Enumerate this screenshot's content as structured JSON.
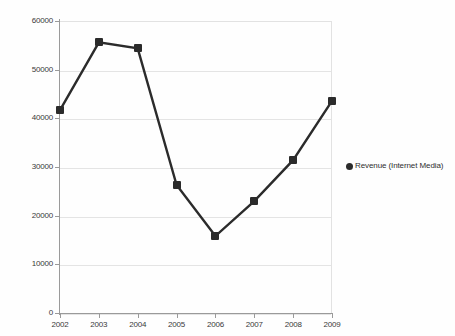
{
  "chart_data": {
    "type": "line",
    "title": "",
    "xlabel": "",
    "ylabel": "",
    "categories": [
      "2002",
      "2003",
      "2004",
      "2005",
      "2006",
      "2007",
      "2008",
      "2009"
    ],
    "values": [
      41700,
      55600,
      54400,
      26300,
      15800,
      23000,
      31400,
      43600
    ],
    "series": [
      {
        "name": "Revenue (Internet Media)",
        "values": [
          41700,
          55600,
          54400,
          26300,
          15800,
          23000,
          31400,
          43600
        ]
      }
    ],
    "ylim": [
      0,
      60000
    ],
    "yticks": [
      0,
      10000,
      20000,
      30000,
      40000,
      50000,
      60000
    ],
    "ytick_labels": [
      "0",
      "10000",
      "20000",
      "30000",
      "40000",
      "50000",
      "60000"
    ],
    "xtick_labels": [
      "2002",
      "2003",
      "2004",
      "2005",
      "2006",
      "2007",
      "2008",
      "2009"
    ],
    "grid": true,
    "legend_position": "right",
    "legend": [
      "Revenue (Internet Media)"
    ],
    "marker": "square",
    "line_color": "#2b2b2b",
    "marker_color": "#2b2b2b",
    "grid_color": "#e4e4e4",
    "axis_color": "#9a9a9a",
    "background_color": "#ffffff"
  },
  "legend": {
    "entries": [
      {
        "label": "Revenue (Internet Media)",
        "marker": "circle-marker"
      }
    ]
  }
}
